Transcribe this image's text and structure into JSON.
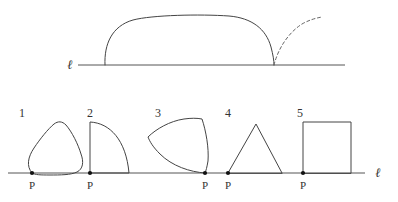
{
  "figure": {
    "background_color": "#ffffff",
    "stroke_color": "#444444",
    "line_color": "#555555",
    "dash_color": "#666666",
    "point_color": "#111111"
  },
  "top_diagram": {
    "name": "convex-body-rolling-on-line",
    "line_label": "ℓ",
    "line": {
      "x1": 78,
      "y1": 65,
      "x2": 345,
      "y2": 65
    },
    "solid_curve_description": "large flat-topped convex arch resting on line from x=105 to x=274",
    "dashed_curve_description": "dashed arc rising to the right from the contact point at x=274 up to x=322, y=17",
    "contact_point_left_x": 105,
    "contact_point_right_x": 274,
    "apex_y": 17
  },
  "bottom_diagram": {
    "name": "five-shapes-on-line",
    "line_label": "ℓ",
    "line": {
      "x1": 8,
      "y1": 173,
      "x2": 365,
      "y2": 173
    },
    "point_label": "P",
    "shapes": [
      {
        "index": "1",
        "name": "rounded-triangle",
        "index_label_x": 22,
        "index_label_y": 113,
        "contact_x": 32,
        "p_label_x": 32,
        "p_label_y": 189
      },
      {
        "index": "2",
        "name": "quarter-disc",
        "index_label_x": 90,
        "index_label_y": 113,
        "contact_x": 90,
        "p_label_x": 90,
        "p_label_y": 189
      },
      {
        "index": "3",
        "name": "reuleaux-triangle",
        "index_label_x": 158,
        "index_label_y": 113,
        "contact_x": 205,
        "p_label_x": 205,
        "p_label_y": 189
      },
      {
        "index": "4",
        "name": "triangle",
        "index_label_x": 228,
        "index_label_y": 113,
        "contact_x": 228,
        "p_label_x": 228,
        "p_label_y": 189
      },
      {
        "index": "5",
        "name": "square",
        "index_label_x": 300,
        "index_label_y": 113,
        "contact_x": 303,
        "p_label_x": 303,
        "p_label_y": 189
      }
    ]
  }
}
